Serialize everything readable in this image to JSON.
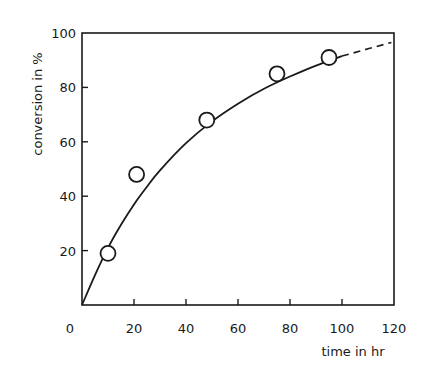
{
  "chart_data": {
    "type": "scatter",
    "title": "",
    "xlabel": "time in hr",
    "ylabel": "conversion in %",
    "xlim": [
      0,
      120
    ],
    "ylim": [
      0,
      100
    ],
    "x_ticks": [
      0,
      20,
      40,
      60,
      80,
      100,
      120
    ],
    "y_ticks": [
      20,
      40,
      60,
      80,
      100
    ],
    "x_tick_labels": [
      "0",
      "20",
      "40",
      "60",
      "80",
      "100",
      "120"
    ],
    "y_tick_labels": [
      "20",
      "40",
      "60",
      "80",
      "100"
    ],
    "grid": false,
    "legend": null,
    "series": [
      {
        "name": "measured conversion",
        "marker": "open-circle",
        "x": [
          10,
          21,
          48,
          75,
          95
        ],
        "y": [
          19,
          48,
          68,
          85,
          91
        ]
      },
      {
        "name": "fitted curve",
        "style": "solid-line",
        "x": [
          0,
          5,
          10,
          15,
          20,
          25,
          30,
          40,
          50,
          60,
          70,
          80,
          90,
          100
        ],
        "y": [
          0,
          11,
          21,
          29.5,
          37,
          43.5,
          49.5,
          59.5,
          67.5,
          74,
          79.5,
          84,
          88,
          91.5
        ]
      },
      {
        "name": "extrapolation",
        "style": "dashed-line",
        "x": [
          100,
          110,
          119
        ],
        "y": [
          91.5,
          94.2,
          96.5
        ]
      }
    ]
  },
  "labels": {
    "xlabel": "time in hr",
    "ylabel": "conversion in %"
  },
  "colors": {
    "ink": "#1a1a1a",
    "background": "#ffffff"
  }
}
